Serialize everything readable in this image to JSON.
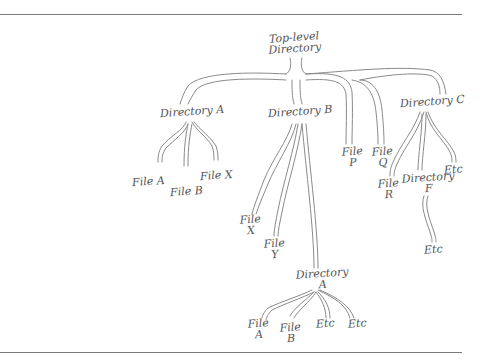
{
  "diagram": {
    "type": "directory-tree",
    "style": "hand-drawn",
    "stroke_color": "#8a8a8a",
    "root": {
      "label": "Top-level\nDirectory",
      "children": [
        {
          "label": "Directory A",
          "children": [
            {
              "label": "File A"
            },
            {
              "label": "File B"
            },
            {
              "label": "File X"
            }
          ]
        },
        {
          "label": "Directory B",
          "children": [
            {
              "label": "File\nX"
            },
            {
              "label": "File\nY"
            },
            {
              "label": "Directory\nA",
              "children": [
                {
                  "label": "File\nA"
                },
                {
                  "label": "File\nB"
                },
                {
                  "label": "Etc"
                },
                {
                  "label": "Etc"
                }
              ]
            }
          ]
        },
        {
          "label": "File\nP"
        },
        {
          "label": "File\nQ"
        },
        {
          "label": "Directory C",
          "children": [
            {
              "label": "File\nR"
            },
            {
              "label": "Directory\nF",
              "children": [
                {
                  "label": "Etc"
                }
              ]
            },
            {
              "label": "Etc"
            }
          ]
        }
      ]
    }
  }
}
